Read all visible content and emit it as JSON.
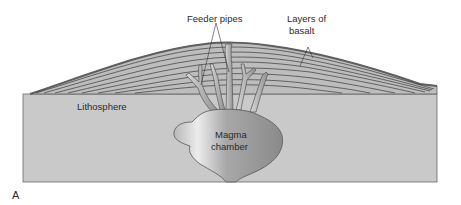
{
  "figure": {
    "panel_label": "A",
    "labels": {
      "feeder_pipes": "Feeder pipes",
      "layers_of_basalt_line1": "Layers of",
      "layers_of_basalt_line2": "basalt",
      "lithosphere": "Lithosphere",
      "magma_chamber_line1": "Magma",
      "magma_chamber_line2": "chamber"
    },
    "colors": {
      "lithosphere_fill": "#c9c9c9",
      "basalt_fill": "#bdbdbd",
      "basalt_top": "#6a6a6a",
      "layer_lines": "#3a3a3a",
      "magma_light": "#e6e6e6",
      "magma_dark": "#8c8c8c",
      "outline": "#555555"
    }
  }
}
